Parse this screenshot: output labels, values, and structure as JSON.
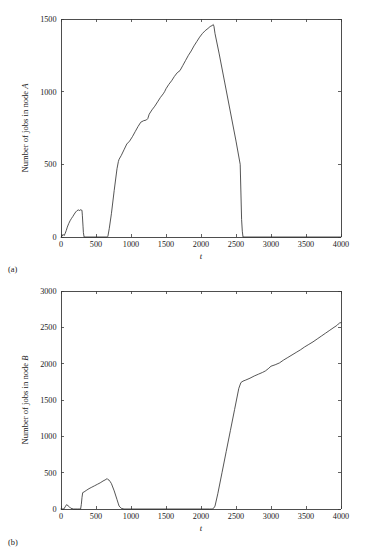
{
  "figure": {
    "panels": [
      {
        "id": "a",
        "label": "(a)",
        "ylabel_prefix": "Number of jobs in node ",
        "ylabel_symbol": "A",
        "xlabel": "t"
      },
      {
        "id": "b",
        "label": "(b)",
        "ylabel_prefix": "Number of jobs in node ",
        "ylabel_symbol": "B",
        "xlabel": "t"
      }
    ]
  },
  "chart_data": [
    {
      "type": "line",
      "title": "",
      "xlabel": "t",
      "ylabel": "Number of jobs in node A",
      "xlim": [
        0,
        4000
      ],
      "ylim": [
        0,
        1500
      ],
      "xticks": [
        0,
        500,
        1000,
        1500,
        2000,
        2500,
        3000,
        3500,
        4000
      ],
      "yticks": [
        0,
        500,
        1000,
        1500
      ],
      "xticklabels": [
        "0",
        "500",
        "1000",
        "1500",
        "2000",
        "2500",
        "3000",
        "3500",
        "4000"
      ],
      "yticklabels": [
        "0",
        "500",
        "1000",
        "1500"
      ],
      "grid": false,
      "legend": null,
      "series": [
        {
          "name": "jobs in node A",
          "x": [
            0,
            15,
            30,
            45,
            60,
            75,
            90,
            110,
            130,
            150,
            170,
            190,
            210,
            230,
            250,
            265,
            275,
            285,
            295,
            300,
            305,
            310,
            315,
            320,
            330,
            400,
            500,
            600,
            660,
            670,
            690,
            720,
            760,
            800,
            820,
            830,
            860,
            900,
            940,
            980,
            1020,
            1060,
            1100,
            1140,
            1180,
            1220,
            1240,
            1260,
            1300,
            1340,
            1380,
            1420,
            1460,
            1480,
            1500,
            1540,
            1580,
            1620,
            1660,
            1700,
            1740,
            1780,
            1820,
            1860,
            1900,
            1940,
            1980,
            2020,
            2060,
            2100,
            2130,
            2160,
            2175,
            2185,
            2200,
            2260,
            2340,
            2420,
            2500,
            2560,
            2580,
            2590,
            2600,
            2800,
            3000,
            3200,
            3400,
            3600,
            3800,
            4000
          ],
          "y": [
            0,
            5,
            18,
            10,
            25,
            45,
            68,
            92,
            112,
            128,
            142,
            158,
            172,
            182,
            186,
            182,
            188,
            184,
            186,
            180,
            150,
            110,
            70,
            30,
            0,
            0,
            0,
            0,
            0,
            5,
            60,
            160,
            320,
            470,
            520,
            535,
            560,
            600,
            640,
            660,
            690,
            725,
            760,
            790,
            800,
            805,
            815,
            845,
            875,
            900,
            930,
            960,
            985,
            1000,
            1020,
            1050,
            1075,
            1105,
            1130,
            1145,
            1180,
            1215,
            1250,
            1280,
            1315,
            1345,
            1375,
            1400,
            1420,
            1435,
            1448,
            1455,
            1462,
            1450,
            1400,
            1260,
            1060,
            860,
            660,
            500,
            120,
            40,
            0,
            0,
            0,
            0,
            0,
            0,
            0,
            0,
            0
          ]
        }
      ]
    },
    {
      "type": "line",
      "title": "",
      "xlabel": "t",
      "ylabel": "Number of jobs in node B",
      "xlim": [
        0,
        4000
      ],
      "ylim": [
        0,
        3000
      ],
      "xticks": [
        0,
        500,
        1000,
        1500,
        2000,
        2500,
        3000,
        3500,
        4000
      ],
      "yticks": [
        0,
        500,
        1000,
        1500,
        2000,
        2500,
        3000
      ],
      "xticklabels": [
        "0",
        "500",
        "1000",
        "1500",
        "2000",
        "2500",
        "3000",
        "3500",
        "4000"
      ],
      "yticklabels": [
        "0",
        "500",
        "1000",
        "1500",
        "2000",
        "2500",
        "3000"
      ],
      "grid": false,
      "legend": null,
      "series": [
        {
          "name": "jobs in node B",
          "x": [
            0,
            40,
            60,
            80,
            100,
            120,
            140,
            180,
            240,
            280,
            290,
            300,
            310,
            330,
            360,
            400,
            440,
            480,
            520,
            560,
            600,
            630,
            650,
            660,
            670,
            690,
            700,
            720,
            760,
            800,
            820,
            830,
            860,
            900,
            1000,
            1200,
            1400,
            1600,
            1800,
            2000,
            2120,
            2160,
            2180,
            2200,
            2240,
            2300,
            2360,
            2420,
            2480,
            2540,
            2570,
            2600,
            2640,
            2700,
            2760,
            2820,
            2880,
            2920,
            2960,
            3000,
            3060,
            3120,
            3180,
            3240,
            3300,
            3360,
            3420,
            3480,
            3540,
            3600,
            3660,
            3720,
            3780,
            3840,
            3900,
            3940,
            3960,
            3980,
            4000
          ],
          "y": [
            0,
            0,
            30,
            60,
            45,
            30,
            10,
            0,
            0,
            0,
            60,
            160,
            225,
            235,
            255,
            280,
            300,
            320,
            340,
            360,
            385,
            400,
            412,
            418,
            405,
            395,
            380,
            350,
            250,
            130,
            70,
            40,
            10,
            0,
            0,
            0,
            0,
            0,
            0,
            0,
            0,
            0,
            10,
            40,
            210,
            500,
            790,
            1080,
            1370,
            1660,
            1740,
            1760,
            1775,
            1800,
            1830,
            1855,
            1880,
            1900,
            1930,
            1965,
            1985,
            2010,
            2050,
            2085,
            2120,
            2155,
            2190,
            2230,
            2265,
            2300,
            2340,
            2380,
            2420,
            2460,
            2500,
            2525,
            2545,
            2560,
            2565
          ]
        }
      ]
    }
  ]
}
